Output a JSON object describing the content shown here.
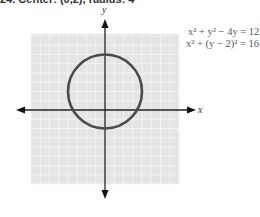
{
  "caption": "24. Center: (0,2), radius: 4",
  "equations": [
    {
      "lhs": "x² + y² − 4y",
      "rhs": "12"
    },
    {
      "lhs": "x² + (y − 2)²",
      "rhs": "16"
    }
  ],
  "equation_lines": [
    "x² + y² − 4y = 12",
    "x² + (y − 2)² = 16"
  ],
  "chart_data": {
    "type": "scatter",
    "title": "",
    "xlabel": "x",
    "ylabel": "y",
    "xlim": [
      -8,
      8
    ],
    "ylim": [
      -8,
      8
    ],
    "grid": true,
    "tick_labels_shown": false,
    "legend": null,
    "annotations": [
      "x² + y² − 4y = 12",
      "x² + (y − 2)² = 16"
    ],
    "series": [
      {
        "name": "circle",
        "shape": "circle",
        "center": [
          0,
          2
        ],
        "radius": 4,
        "equation": "x² + (y − 2)² = 16",
        "key_points": [
          [
            0,
            6
          ],
          [
            0,
            -2
          ],
          [
            4,
            2
          ],
          [
            -4,
            2
          ]
        ]
      }
    ]
  },
  "colors": {
    "grid_bg": "#e4e4e4",
    "grid_line": "#f6f6f6",
    "axis": "#222222",
    "curve": "#4a4a4a",
    "text": "#555555"
  }
}
